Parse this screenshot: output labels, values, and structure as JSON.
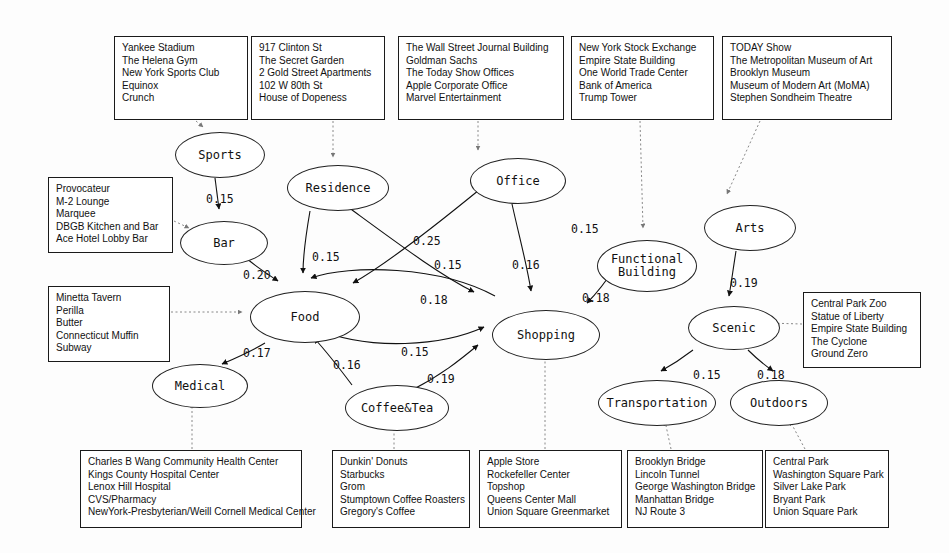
{
  "diagram": {
    "type": "directed-weighted-graph",
    "nodes": [
      {
        "id": "sports",
        "label": "Sports",
        "x": 175,
        "y": 132,
        "w": 90,
        "h": 46
      },
      {
        "id": "residence",
        "label": "Residence",
        "x": 287,
        "y": 165,
        "w": 102,
        "h": 46
      },
      {
        "id": "office",
        "label": "Office",
        "x": 470,
        "y": 158,
        "w": 96,
        "h": 46
      },
      {
        "id": "arts",
        "label": "Arts",
        "x": 704,
        "y": 205,
        "w": 92,
        "h": 46
      },
      {
        "id": "bar",
        "label": "Bar",
        "x": 180,
        "y": 221,
        "w": 88,
        "h": 44
      },
      {
        "id": "functional",
        "label": "Functional\nBuilding",
        "x": 597,
        "y": 240,
        "w": 100,
        "h": 52
      },
      {
        "id": "food",
        "label": "Food",
        "x": 250,
        "y": 291,
        "w": 110,
        "h": 52
      },
      {
        "id": "shopping",
        "label": "Shopping",
        "x": 492,
        "y": 310,
        "w": 108,
        "h": 50
      },
      {
        "id": "scenic",
        "label": "Scenic",
        "x": 688,
        "y": 306,
        "w": 92,
        "h": 44
      },
      {
        "id": "medical",
        "label": "Medical",
        "x": 152,
        "y": 364,
        "w": 96,
        "h": 44
      },
      {
        "id": "coffee",
        "label": "Coffee&Tea",
        "x": 345,
        "y": 385,
        "w": 104,
        "h": 46
      },
      {
        "id": "transport",
        "label": "Transportation",
        "x": 598,
        "y": 380,
        "w": 118,
        "h": 46
      },
      {
        "id": "outdoors",
        "label": "Outdoors",
        "x": 730,
        "y": 380,
        "w": 98,
        "h": 46
      }
    ],
    "edges": [
      {
        "from": "sports",
        "to": "bar",
        "weight": "0.15",
        "lx": 206,
        "ly": 192
      },
      {
        "from": "bar",
        "to": "food",
        "weight": "0.20",
        "lx": 243,
        "ly": 268
      },
      {
        "from": "residence",
        "to": "food",
        "weight": "0.15",
        "lx": 312,
        "ly": 250
      },
      {
        "from": "office",
        "to": "food",
        "weight": "0.25",
        "lx": 413,
        "ly": 234
      },
      {
        "from": "residence",
        "to": "shopping",
        "weight": "0.15",
        "lx": 434,
        "ly": 258
      },
      {
        "from": "office",
        "to": "shopping",
        "weight": "0.16",
        "lx": 512,
        "ly": 258
      },
      {
        "from": "office",
        "to": "functional",
        "weight": "0.15",
        "lx": 571,
        "ly": 222
      },
      {
        "from": "functional",
        "to": "shopping",
        "weight": "0.18",
        "lx": 582,
        "ly": 291
      },
      {
        "from": "shopping",
        "to": "food",
        "weight": "0.18",
        "lx": 420,
        "ly": 293
      },
      {
        "from": "food",
        "to": "shopping",
        "weight": "0.15",
        "lx": 401,
        "ly": 345
      },
      {
        "from": "food",
        "to": "medical",
        "weight": "0.17",
        "lx": 243,
        "ly": 346
      },
      {
        "from": "coffee",
        "to": "food",
        "weight": "0.16",
        "lx": 333,
        "ly": 358
      },
      {
        "from": "coffee",
        "to": "shopping",
        "weight": "0.19",
        "lx": 427,
        "ly": 372
      },
      {
        "from": "arts",
        "to": "scenic",
        "weight": "0.19",
        "lx": 730,
        "ly": 276
      },
      {
        "from": "scenic",
        "to": "transport",
        "weight": "0.15",
        "lx": 693,
        "ly": 368
      },
      {
        "from": "scenic",
        "to": "outdoors",
        "weight": "0.18",
        "lx": 757,
        "ly": 368
      }
    ],
    "boxes": [
      {
        "id": "sports-venues",
        "node": "sports",
        "x": 114,
        "y": 36,
        "w": 134,
        "h": 84,
        "items": [
          "Yankee Stadium",
          "The Helena Gym",
          "New York Sports Club",
          "Equinox",
          "Crunch"
        ]
      },
      {
        "id": "residence-venues",
        "node": "residence",
        "x": 251,
        "y": 36,
        "w": 134,
        "h": 84,
        "items": [
          "917 Clinton St",
          "The Secret Garden",
          "2 Gold Street Apartments",
          "102 W 80th St",
          "House of Dopeness"
        ]
      },
      {
        "id": "office-venues",
        "node": "office",
        "x": 398,
        "y": 36,
        "w": 166,
        "h": 84,
        "items": [
          "The Wall Street Journal Building",
          "Goldman Sachs",
          "The Today Show Offices",
          "Apple Corporate Office",
          "Marvel Entertainment"
        ]
      },
      {
        "id": "functional-venues",
        "node": "functional",
        "x": 571,
        "y": 36,
        "w": 143,
        "h": 84,
        "items": [
          "New York Stock Exchange",
          "Empire State Building",
          "One World Trade Center",
          "Bank of America",
          "Trump Tower"
        ]
      },
      {
        "id": "arts-venues",
        "node": "arts",
        "x": 722,
        "y": 36,
        "w": 170,
        "h": 84,
        "items": [
          "TODAY Show",
          "The Metropolitan Museum of Art",
          "Brooklyn Museum",
          "Museum of Modern Art (MoMA)",
          "Stephen Sondheim Theatre"
        ]
      },
      {
        "id": "bar-venues",
        "node": "bar",
        "x": 48,
        "y": 177,
        "w": 125,
        "h": 76,
        "items": [
          "Provocateur",
          "M-2 Lounge",
          "Marquee",
          "DBGB Kitchen and Bar",
          "Ace Hotel Lobby Bar"
        ]
      },
      {
        "id": "food-venues",
        "node": "food",
        "x": 48,
        "y": 286,
        "w": 122,
        "h": 76,
        "items": [
          "Minetta Tavern",
          "Perilla",
          "Butter",
          "Connecticut Muffin",
          "Subway"
        ]
      },
      {
        "id": "scenic-venues",
        "node": "scenic",
        "x": 803,
        "y": 292,
        "w": 118,
        "h": 76,
        "items": [
          "Central Park Zoo",
          "Statue of Liberty",
          "Empire State Building",
          "The Cyclone",
          "Ground Zero"
        ]
      },
      {
        "id": "medical-venues",
        "node": "medical",
        "x": 80,
        "y": 450,
        "w": 222,
        "h": 78,
        "items": [
          "Charles B Wang Community Health Center",
          "Kings County Hospital Center",
          "Lenox Hill Hospital",
          "CVS/Pharmacy",
          "NewYork-Presbyterian/Weill Cornell Medical Center"
        ]
      },
      {
        "id": "coffee-venues",
        "node": "coffee",
        "x": 332,
        "y": 450,
        "w": 138,
        "h": 78,
        "items": [
          "Dunkin' Donuts",
          "Starbucks",
          "Grom",
          "Stumptown Coffee Roasters",
          "Gregory's Coffee"
        ]
      },
      {
        "id": "shopping-venues",
        "node": "shopping",
        "x": 479,
        "y": 450,
        "w": 143,
        "h": 78,
        "items": [
          "Apple Store",
          "Rockefeller Center",
          "Topshop",
          "Queens Center Mall",
          "Union Square Greenmarket"
        ]
      },
      {
        "id": "transport-venues",
        "node": "transport",
        "x": 627,
        "y": 450,
        "w": 136,
        "h": 78,
        "items": [
          "Brooklyn Bridge",
          "Lincoln Tunnel",
          "George Washington Bridge",
          "Manhattan Bridge",
          "NJ Route 3"
        ]
      },
      {
        "id": "outdoors-venues",
        "node": "outdoors",
        "x": 765,
        "y": 450,
        "w": 124,
        "h": 78,
        "items": [
          "Central Park",
          "Washington Square Park",
          "Silver Lake Park",
          "Bryant Park",
          "Union Square Park"
        ]
      }
    ],
    "dotted_links": [
      {
        "from": "sports-venues",
        "to": "sports",
        "path": "M 196 121 L 203 127"
      },
      {
        "from": "residence-venues",
        "to": "residence",
        "path": "M 333 121 L 333 157"
      },
      {
        "from": "office-venues",
        "to": "office",
        "path": "M 478 121 L 478 150"
      },
      {
        "from": "functional-venues",
        "to": "functional",
        "path": "M 640 121 L 643 228"
      },
      {
        "from": "arts-venues",
        "to": "arts",
        "path": "M 760 121 L 727 194"
      },
      {
        "from": "bar-venues",
        "to": "bar",
        "path": "M 174 221 L 189 228"
      },
      {
        "from": "food-venues",
        "to": "food",
        "path": "M 171 312 L 242 312"
      },
      {
        "from": "scenic-venues",
        "to": "scenic",
        "path": "M 802 324 L 767 323"
      },
      {
        "from": "medical-venues",
        "to": "medical",
        "path": "M 192 449 L 192 403"
      },
      {
        "from": "coffee-venues",
        "to": "coffee",
        "path": "M 394 449 L 394 425"
      },
      {
        "from": "shopping-venues",
        "to": "shopping",
        "path": "M 545 449 L 545 353"
      },
      {
        "from": "transport-venues",
        "to": "transport",
        "path": "M 671 449 L 665 421"
      },
      {
        "from": "outdoors-venues",
        "to": "outdoors",
        "path": "M 805 449 L 790 421"
      }
    ],
    "edge_paths": {
      "sports-bar": "M 215 178 L 219 209",
      "bar-food": "M 245 257 C 255 266 266 273 278 281",
      "residence-food": "M 310 211 C 305 240 303 260 303 273",
      "office-food": "M 479 190 C 430 230 385 265 353 283",
      "residence-shopping": "M 348 207 C 400 245 440 275 474 292",
      "office-shopping": "M 512 204 C 520 240 527 265 531 291",
      "functional-shopping": "M 616 266 C 605 283 595 295 587 303",
      "shopping-food": "M 495 296 C 440 266 350 264 311 278",
      "food-shopping": "M 312 327 C 370 353 445 345 484 327",
      "food-medical": "M 265 343 C 250 352 236 358 222 364",
      "coffee-food": "M 352 385 C 337 365 325 350 314 338",
      "coffee-shopping": "M 412 390 C 440 376 460 360 478 345",
      "arts-scenic": "M 736 251 C 733 270 731 285 729 296",
      "scenic-transport": "M 693 350 C 680 360 670 366 661 371",
      "scenic-outdoors": "M 748 350 C 758 360 766 366 773 371"
    }
  }
}
